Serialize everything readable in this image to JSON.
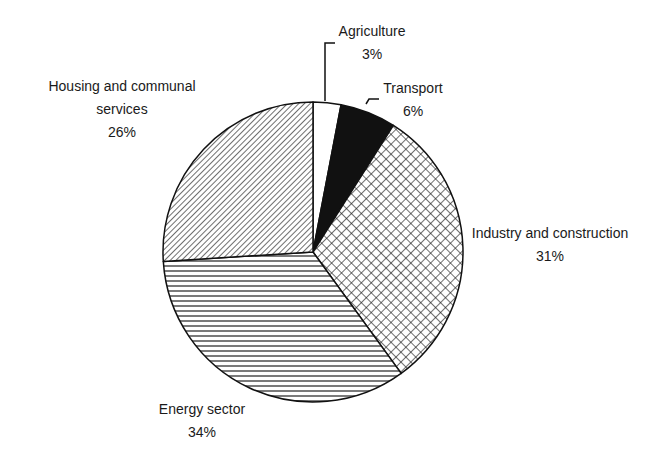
{
  "chart_data": {
    "type": "pie",
    "title": "",
    "start_angle": "12 o'clock",
    "direction": "clockwise",
    "legend": "none (direct labels)",
    "slices": [
      {
        "label": "Agriculture",
        "value": 3,
        "display": "3%",
        "fill": "white"
      },
      {
        "label": "Transport",
        "value": 6,
        "display": "6%",
        "fill": "solid-black"
      },
      {
        "label": "Industry and construction",
        "value": 31,
        "display": "31%",
        "fill": "crosshatch"
      },
      {
        "label": "Energy sector",
        "value": 34,
        "display": "34%",
        "fill": "horizontal-lines"
      },
      {
        "label": "Housing and communal services",
        "value": 26,
        "display": "26%",
        "fill": "diagonal-lines"
      }
    ]
  },
  "labels": {
    "agriculture": {
      "name": "Agriculture",
      "pct": "3%"
    },
    "transport": {
      "name": "Transport",
      "pct": "6%"
    },
    "industry": {
      "name": "Industry and construction",
      "pct": "31%"
    },
    "energy": {
      "name": "Energy sector",
      "pct": "34%"
    },
    "housing": {
      "line1": "Housing and communal",
      "line2": "services",
      "pct": "26%"
    }
  },
  "colors": {
    "stroke": "#111111",
    "background": "#ffffff"
  }
}
